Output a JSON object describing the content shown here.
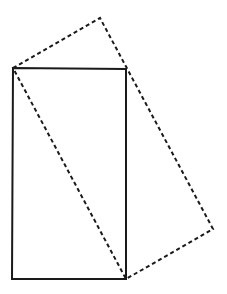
{
  "diagram": {
    "width": 227,
    "height": 294,
    "background": "#ffffff",
    "stroke_color": "#1a1a1a",
    "solid_rectangle": {
      "points": [
        [
          13,
          68
        ],
        [
          126,
          69
        ],
        [
          126,
          279
        ],
        [
          12,
          279
        ]
      ],
      "style": "solid",
      "stroke_width": 2
    },
    "dashed_rectangle": {
      "points": [
        [
          13,
          68
        ],
        [
          100,
          18
        ],
        [
          213,
          229
        ],
        [
          126,
          279
        ]
      ],
      "style": "dashed",
      "stroke_width": 2,
      "dash": "4,3"
    }
  }
}
